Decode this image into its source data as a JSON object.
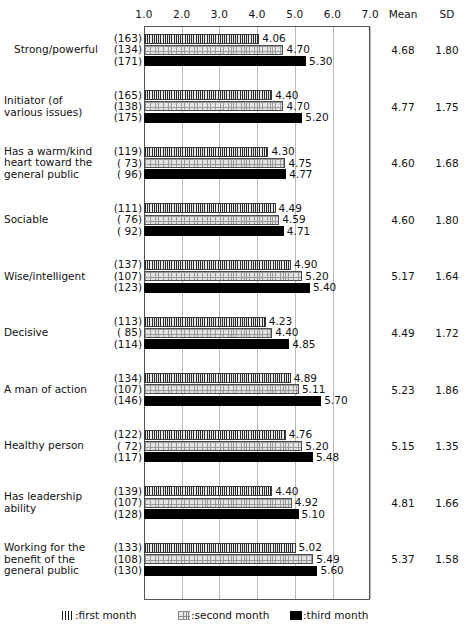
{
  "chart_data": {
    "type": "bar",
    "title": "",
    "xlabel": "",
    "ylabel": "",
    "orientation": "horizontal",
    "grid": true,
    "xlim": [
      1.0,
      7.0
    ],
    "xticks": [
      "1.0",
      "2.0",
      "3.0",
      "4.0",
      "5.0",
      "6.0",
      "7.0"
    ],
    "legend_position": "bottom",
    "column_headers": {
      "mean": "Mean",
      "sd": "SD"
    },
    "series": [
      {
        "name": "first month",
        "key": "m1",
        "pattern": "vertical-stripes",
        "color": "#8f8f8f"
      },
      {
        "name": "second month",
        "key": "m2",
        "pattern": "cross-hatch",
        "color": "#e3e3e3"
      },
      {
        "name": "third month",
        "key": "m3",
        "pattern": "solid",
        "color": "#000000"
      }
    ],
    "legend": [
      {
        "marker": "|||||",
        "separator": ":",
        "label": "first month"
      },
      {
        "marker": "",
        "separator": ":",
        "label": "second month"
      },
      {
        "marker": "",
        "separator": ":",
        "label": "third month"
      }
    ],
    "categories": [
      "Strong/powerful",
      "Initiator (of various issues)",
      "Has a warm/kind heart toward the general public",
      "Sociable",
      "Wise/intelligent",
      "Decisive",
      "A man of action",
      "Healthy person",
      "Has leadership ability",
      "Working for the benefit of the general public"
    ],
    "items": [
      {
        "label": "Strong/powerful",
        "label_lines": [
          "Strong/powerful"
        ],
        "label_align": "center",
        "values": [
          4.06,
          4.7,
          5.3
        ],
        "value_labels": [
          "4.06",
          "4.70",
          "5.30"
        ],
        "n": [
          163,
          134,
          171
        ],
        "n_labels": [
          "(163)",
          "(134)",
          "(171)"
        ],
        "mean": "4.68",
        "sd": "1.80"
      },
      {
        "label": "Initiator (of various issues)",
        "label_lines": [
          "Initiator (of",
          "various issues)"
        ],
        "label_align": "left",
        "values": [
          4.4,
          4.7,
          5.2
        ],
        "value_labels": [
          "4.40",
          "4.70",
          "5.20"
        ],
        "n": [
          165,
          138,
          175
        ],
        "n_labels": [
          "(165)",
          "(138)",
          "(175)"
        ],
        "mean": "4.77",
        "sd": "1.75"
      },
      {
        "label": "Has a warm/kind heart toward the general public",
        "label_lines": [
          "Has a warm/kind",
          "heart toward the",
          "general public"
        ],
        "label_align": "left",
        "values": [
          4.3,
          4.75,
          4.77
        ],
        "value_labels": [
          "4.30",
          "4.75",
          "4.77"
        ],
        "n": [
          119,
          73,
          96
        ],
        "n_labels": [
          "(119)",
          "( 73)",
          "( 96)"
        ],
        "mean": "4.60",
        "sd": "1.68"
      },
      {
        "label": "Sociable",
        "label_lines": [
          "Sociable"
        ],
        "label_align": "left",
        "values": [
          4.49,
          4.59,
          4.71
        ],
        "value_labels": [
          "4.49",
          "4.59",
          "4.71"
        ],
        "n": [
          111,
          76,
          92
        ],
        "n_labels": [
          "(111)",
          "( 76)",
          "( 92)"
        ],
        "mean": "4.60",
        "sd": "1.80"
      },
      {
        "label": "Wise/intelligent",
        "label_lines": [
          "Wise/intelligent"
        ],
        "label_align": "left",
        "values": [
          4.9,
          5.2,
          5.4
        ],
        "value_labels": [
          "4.90",
          "5.20",
          "5.40"
        ],
        "n": [
          137,
          107,
          123
        ],
        "n_labels": [
          "(137)",
          "(107)",
          "(123)"
        ],
        "mean": "5.17",
        "sd": "1.64"
      },
      {
        "label": "Decisive",
        "label_lines": [
          "Decisive"
        ],
        "label_align": "left",
        "values": [
          4.23,
          4.4,
          4.85
        ],
        "value_labels": [
          "4.23",
          "4.40",
          "4.85"
        ],
        "n": [
          113,
          85,
          114
        ],
        "n_labels": [
          "(113)",
          "( 85)",
          "(114)"
        ],
        "mean": "4.49",
        "sd": "1.72"
      },
      {
        "label": "A man of action",
        "label_lines": [
          "A man of action"
        ],
        "label_align": "left",
        "values": [
          4.89,
          5.11,
          5.7
        ],
        "value_labels": [
          "4.89",
          "5.11",
          "5.70"
        ],
        "n": [
          134,
          107,
          146
        ],
        "n_labels": [
          "(134)",
          "(107)",
          "(146)"
        ],
        "mean": "5.23",
        "sd": "1.86"
      },
      {
        "label": "Healthy person",
        "label_lines": [
          "Healthy person"
        ],
        "label_align": "left",
        "values": [
          4.76,
          5.2,
          5.48
        ],
        "value_labels": [
          "4.76",
          "5.20",
          "5.48"
        ],
        "n": [
          122,
          72,
          117
        ],
        "n_labels": [
          "(122)",
          "( 72)",
          "(117)"
        ],
        "mean": "5.15",
        "sd": "1.35"
      },
      {
        "label": "Has leadership ability",
        "label_lines": [
          "Has leadership",
          "ability"
        ],
        "label_align": "left",
        "values": [
          4.4,
          4.92,
          5.1
        ],
        "value_labels": [
          "4.40",
          "4.92",
          "5.10"
        ],
        "n": [
          139,
          107,
          128
        ],
        "n_labels": [
          "(139)",
          "(107)",
          "(128)"
        ],
        "mean": "4.81",
        "sd": "1.66"
      },
      {
        "label": "Working for the benefit of the general public",
        "label_lines": [
          "Working for the",
          "benefit of the",
          "general public"
        ],
        "label_align": "left",
        "values": [
          5.02,
          5.49,
          5.6
        ],
        "value_labels": [
          "5.02",
          "5.49",
          "5.60"
        ],
        "n": [
          133,
          108,
          130
        ],
        "n_labels": [
          "(133)",
          "(108)",
          "(130)"
        ],
        "mean": "5.37",
        "sd": "1.58"
      }
    ]
  }
}
